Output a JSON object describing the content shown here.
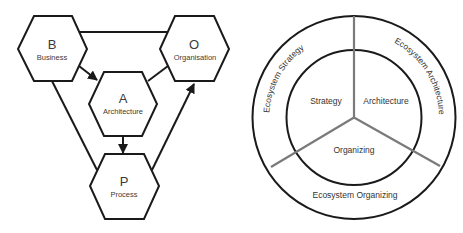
{
  "left_diagram": {
    "title": "BAOP hexagon model",
    "nodes": [
      {
        "id": "B",
        "letter": "B",
        "label": "Business"
      },
      {
        "id": "O",
        "letter": "O",
        "label": "Organisation"
      },
      {
        "id": "A",
        "letter": "A",
        "label": "Architecture"
      },
      {
        "id": "P",
        "letter": "P",
        "label": "Process"
      }
    ],
    "edges": [
      {
        "from": "B",
        "to": "O",
        "arrow": false
      },
      {
        "from": "B",
        "to": "A",
        "arrow": true
      },
      {
        "from": "A",
        "to": "O",
        "arrow": false
      },
      {
        "from": "A",
        "to": "P",
        "arrow": true
      },
      {
        "from": "B",
        "to": "P",
        "arrow": false
      },
      {
        "from": "P",
        "to": "O",
        "arrow": true
      }
    ]
  },
  "right_diagram": {
    "title": "Ecosystem ring model",
    "inner_segments": [
      {
        "label": "Strategy"
      },
      {
        "label": "Architecture"
      },
      {
        "label": "Organizing"
      }
    ],
    "outer_segments": [
      {
        "label": "Ecosystem Strategy"
      },
      {
        "label": "Ecosystem Architecture"
      },
      {
        "label": "Ecosystem Organizing"
      }
    ],
    "colors": {
      "ring_stroke": "#1a1a1a",
      "divider_stroke": "#7a7a7a"
    }
  }
}
